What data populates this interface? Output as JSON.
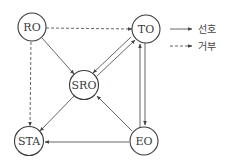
{
  "diagram": {
    "nodes": [
      {
        "id": "RO",
        "label": "RO"
      },
      {
        "id": "TO",
        "label": "TO"
      },
      {
        "id": "SRO",
        "label": "SRO"
      },
      {
        "id": "STA",
        "label": "STA"
      },
      {
        "id": "EO",
        "label": "EO"
      }
    ],
    "edges": [
      {
        "from": "RO",
        "to": "TO",
        "type": "dashed"
      },
      {
        "from": "RO",
        "to": "STA",
        "type": "dashed"
      },
      {
        "from": "RO",
        "to": "SRO",
        "type": "solid"
      },
      {
        "from": "TO",
        "to": "SRO",
        "type": "solid"
      },
      {
        "from": "SRO",
        "to": "TO",
        "type": "solid"
      },
      {
        "from": "TO",
        "to": "EO",
        "type": "solid"
      },
      {
        "from": "EO",
        "to": "TO",
        "type": "solid"
      },
      {
        "from": "SRO",
        "to": "STA",
        "type": "solid"
      },
      {
        "from": "EO",
        "to": "SRO",
        "type": "solid"
      },
      {
        "from": "EO",
        "to": "STA",
        "type": "solid"
      }
    ]
  },
  "legend": {
    "items": [
      {
        "label": "선호",
        "line": "solid"
      },
      {
        "label": "거부",
        "line": "dashed"
      }
    ]
  },
  "colors": {
    "line": "#555555",
    "node_stroke": "#3a3a3a",
    "text": "#3a3a3a",
    "background": "#ffffff"
  }
}
